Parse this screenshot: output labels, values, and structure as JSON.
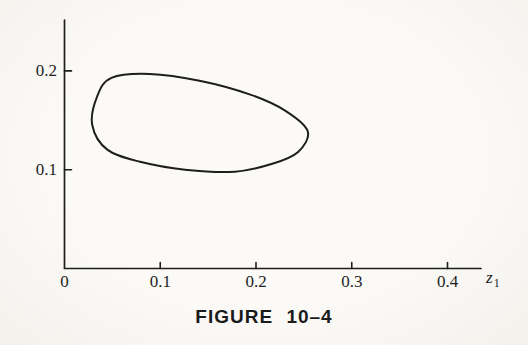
{
  "page": {
    "background": "#f8f7f4",
    "ink_color": "#1e1e1e"
  },
  "figure": {
    "caption": "FIGURE 10–4",
    "axis_label": {
      "base": "z",
      "sub": "1"
    }
  },
  "chart_data": {
    "type": "line",
    "title": "",
    "xlabel": "z1",
    "ylabel": "",
    "xlim": [
      0,
      0.44
    ],
    "ylim": [
      0,
      0.25
    ],
    "grid": false,
    "legend": "none",
    "x_ticks": {
      "values": [
        0,
        0.1,
        0.2,
        0.3,
        0.4
      ],
      "labels": [
        "0",
        "0.1",
        "0.2",
        "0.3",
        "0.4"
      ]
    },
    "y_ticks": {
      "values": [
        0.1,
        0.2
      ],
      "labels": [
        "0.1",
        "0.2"
      ]
    },
    "line_color": "#1e1e1e",
    "series": [
      {
        "name": "closed-contour",
        "closed": true,
        "points": [
          [
            0.029,
            0.145
          ],
          [
            0.034,
            0.174
          ],
          [
            0.049,
            0.193
          ],
          [
            0.089,
            0.197
          ],
          [
            0.141,
            0.19
          ],
          [
            0.194,
            0.176
          ],
          [
            0.23,
            0.16
          ],
          [
            0.254,
            0.139
          ],
          [
            0.244,
            0.118
          ],
          [
            0.217,
            0.106
          ],
          [
            0.178,
            0.098
          ],
          [
            0.126,
            0.1
          ],
          [
            0.079,
            0.108
          ],
          [
            0.045,
            0.12
          ]
        ]
      }
    ]
  }
}
